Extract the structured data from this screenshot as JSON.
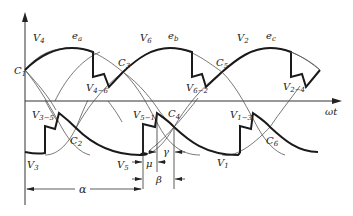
{
  "diagram": {
    "axis": {
      "x_label": "ωt"
    },
    "upper_labels": {
      "V4": "V",
      "V4_sub": "4",
      "ea": "e",
      "ea_sub": "a",
      "V6": "V",
      "V6_sub": "6",
      "eb": "e",
      "eb_sub": "b",
      "V2": "V",
      "V2_sub": "2",
      "ec": "e",
      "ec_sub": "c",
      "V46": "V",
      "V46_sub": "4−6",
      "V62": "V",
      "V62_sub": "6−2",
      "V24": "V",
      "V24_sub": "2−4"
    },
    "crossing_points": {
      "C1": "C",
      "C1_sub": "1",
      "C2": "C",
      "C2_sub": "2",
      "C3": "C",
      "C3_sub": "3",
      "C4": "C",
      "C4_sub": "4",
      "C5": "C",
      "C5_sub": "5",
      "C6": "C",
      "C6_sub": "6"
    },
    "lower_labels": {
      "V3": "V",
      "V3_sub": "3",
      "V5": "V",
      "V5_sub": "5",
      "V1": "V",
      "V1_sub": "1",
      "V35": "V",
      "V35_sub": "3−5",
      "V51": "V",
      "V51_sub": "5−1",
      "V13": "V",
      "V13_sub": "1−3"
    },
    "angles": {
      "alpha": "α",
      "mu": "μ",
      "gamma": "γ",
      "beta": "β"
    }
  }
}
